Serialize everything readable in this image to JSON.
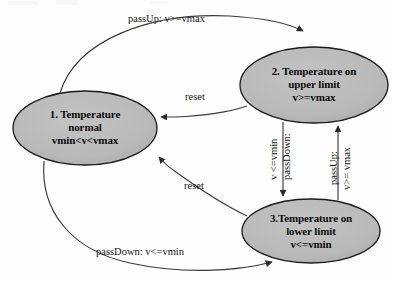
{
  "diagram": {
    "type": "state-diagram",
    "colors": {
      "state_fill": "#b9b9b9",
      "state_stroke": "#1a1a1a",
      "edge_stroke": "#3a3a3a",
      "text": "#0b0b0b",
      "background": "#fefefe"
    },
    "states": [
      {
        "id": "state-1",
        "name": "temperature-normal",
        "lines": [
          "1. Temperature",
          "normal",
          "vmin<v<vmax"
        ],
        "cx": 85,
        "cy": 128,
        "rx": 72,
        "ry": 37
      },
      {
        "id": "state-2",
        "name": "temperature-upper-limit",
        "lines": [
          "2. Temperature on",
          "upper limit",
          "v>=vmax"
        ],
        "cx": 314,
        "cy": 85,
        "rx": 74,
        "ry": 38
      },
      {
        "id": "state-3",
        "name": "temperature-lower-limit",
        "lines": [
          "3.Temperature on",
          "lower limit",
          "v<=vmin"
        ],
        "cx": 311,
        "cy": 231,
        "rx": 69,
        "ry": 32
      }
    ],
    "transitions": [
      {
        "id": "t1",
        "name": "pass-up-normal-to-upper",
        "from": "state-1",
        "to": "state-2",
        "label": "passUp: v>=vmax",
        "label_lines": [
          "passUp: v>=vmax"
        ],
        "rotated": false
      },
      {
        "id": "t2",
        "name": "reset-upper-to-normal",
        "from": "state-2",
        "to": "state-1",
        "label": "reset",
        "label_lines": [
          "reset"
        ],
        "rotated": false
      },
      {
        "id": "t3",
        "name": "pass-down-upper-to-lower",
        "from": "state-2",
        "to": "state-3",
        "label": "passDown: v <=vmin",
        "label_lines": [
          "passDown:",
          "v <=vmin"
        ],
        "rotated": true
      },
      {
        "id": "t4",
        "name": "pass-up-lower-to-upper",
        "from": "state-3",
        "to": "state-2",
        "label": "passUp: v>= vmax",
        "label_lines": [
          "passUp:",
          "v>= vmax"
        ],
        "rotated": true
      },
      {
        "id": "t5",
        "name": "reset-lower-to-normal",
        "from": "state-3",
        "to": "state-1",
        "label": "reset",
        "label_lines": [
          "reset"
        ],
        "rotated": false
      },
      {
        "id": "t6",
        "name": "pass-down-normal-to-lower",
        "from": "state-1",
        "to": "state-3",
        "label": "passDown: v<=vmin",
        "label_lines": [
          "passDown: v<=vmin"
        ],
        "rotated": false
      }
    ]
  }
}
